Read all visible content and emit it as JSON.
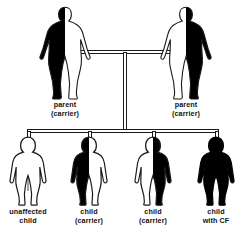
{
  "diagram": {
    "colors": {
      "carrier_fill": "#000000",
      "unaffected_fill": "#ffffff",
      "affected_fill": "#000000",
      "outline": "#1a1a1a",
      "background": "#ffffff",
      "text": "#111111"
    },
    "generations": [
      {
        "name": "parents",
        "members": [
          {
            "id": "parent-left",
            "label_line1": "parent",
            "label_line2": "(carrier)",
            "figure_type": "adult",
            "fill_state": "half-left-black",
            "genotype_meaning": "carrier"
          },
          {
            "id": "parent-right",
            "label_line1": "parent",
            "label_line2": "(carrier)",
            "figure_type": "adult",
            "fill_state": "half-right-black",
            "genotype_meaning": "carrier"
          }
        ]
      },
      {
        "name": "children",
        "members": [
          {
            "id": "child-1",
            "label_line1": "unaffected",
            "label_line2": "child",
            "figure_type": "child",
            "fill_state": "all-white",
            "genotype_meaning": "unaffected"
          },
          {
            "id": "child-2",
            "label_line1": "child",
            "label_line2": "(carrier)",
            "figure_type": "child",
            "fill_state": "half-left-black",
            "genotype_meaning": "carrier"
          },
          {
            "id": "child-3",
            "label_line1": "child",
            "label_line2": "(carrier)",
            "figure_type": "child",
            "fill_state": "half-right-black",
            "genotype_meaning": "carrier"
          },
          {
            "id": "child-4",
            "label_line1": "child",
            "label_line2": "with CF",
            "figure_type": "child",
            "fill_state": "all-black",
            "genotype_meaning": "affected"
          }
        ]
      }
    ]
  }
}
